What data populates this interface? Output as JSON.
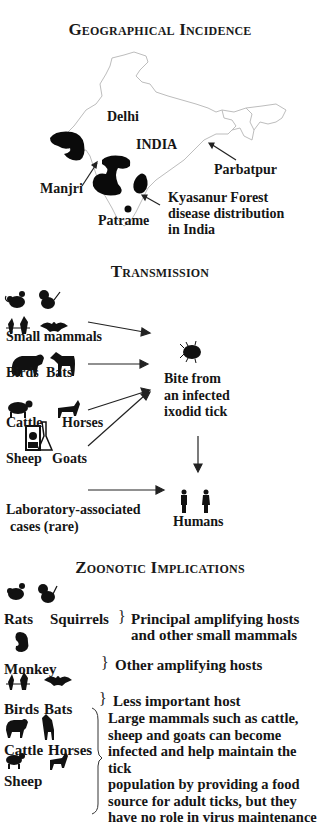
{
  "sections": {
    "geo": {
      "title": "Geographical Incidence",
      "map_labels": {
        "delhi": "Delhi",
        "india": "INDIA",
        "manjri": "Manjri",
        "parbatpur": "Parbatpur",
        "patrame": "Patrame",
        "kfd": [
          "Kyasanur Forest",
          "disease distribution",
          "in India"
        ]
      }
    },
    "transmission": {
      "title": "Transmission",
      "sources": {
        "small_mammals": "Small mammals",
        "birds": "Birds",
        "bats": "Bats",
        "cattle": "Cattle",
        "horses": "Horses",
        "sheep": "Sheep",
        "goats": "Goats",
        "lab": [
          "Laboratory-associated",
          "cases (rare)"
        ]
      },
      "tick": [
        "Bite from",
        "an infected",
        "ixodid tick"
      ],
      "humans": "Humans"
    },
    "zoonotic": {
      "title": "Zoonotic Implications",
      "rats": "Rats",
      "squirrels": "Squirrels",
      "principal": [
        "Principal amplifying hosts",
        "and other small mammals"
      ],
      "monkey": "Monkey",
      "other": "Other amplifying hosts",
      "birds": "Birds",
      "bats": "Bats",
      "less": "Less important host",
      "cattle": "Cattle",
      "horses": "Horses",
      "sheep": "Sheep",
      "large": [
        "Large mammals such as cattle,",
        "sheep and goats can become",
        "infected and help maintain the tick",
        "population by providing a food",
        "source for adult ticks, but they",
        "have no role in virus maintenance"
      ]
    }
  },
  "icons": {
    "rat": "rat-icon",
    "squirrel": "squirrel-icon",
    "bird": "birds-icon",
    "bat": "bat-icon",
    "cattle": "cattle-icon",
    "horse": "horse-icon",
    "sheep": "sheep-icon",
    "goat": "goat-icon",
    "lab": "laboratory-icon",
    "tick": "tick-icon",
    "human": "human-icon",
    "monkey": "monkey-icon"
  },
  "colors": {
    "ink": "#111111",
    "map_outline": "#b8b8b8",
    "background": "#ffffff"
  }
}
